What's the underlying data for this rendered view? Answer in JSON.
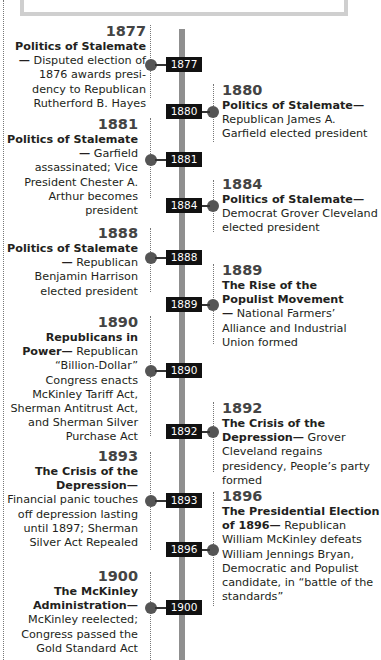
{
  "axis": {
    "color": "#8f8f8f"
  },
  "events": [
    {
      "year": "1877",
      "side": "left",
      "heading": "Politics of Stalemate—",
      "body": "Disputed election of 1876 awards presi-dency to Republican Rutherford B. Hayes",
      "label": "1877"
    },
    {
      "year": "1880",
      "side": "right",
      "heading": "Politics of Stalemate—",
      "body": "Republican James A. Garfield elected president",
      "label": "1880"
    },
    {
      "year": "1881",
      "side": "left",
      "heading": "Politics of Stalemate—",
      "body": "Garfield assassinated; Vice President Chester A. Arthur becomes president",
      "label": "1881"
    },
    {
      "year": "1884",
      "side": "right",
      "heading": "Politics of Stalemate—",
      "body": "Democrat Grover Cleveland elected president",
      "label": "1884"
    },
    {
      "year": "1888",
      "side": "left",
      "heading": "Politics of Stalemate—",
      "body": "Republican Benjamin Harrison elected president",
      "label": "1888"
    },
    {
      "year": "1889",
      "side": "right",
      "heading": "The Rise of the Populist Movement—",
      "body": "National Farmers’ Alliance and Industrial Union formed",
      "label": "1889"
    },
    {
      "year": "1890",
      "side": "left",
      "heading": "Republicans in Power—",
      "body": "Republican “Billion-Dollar” Congress enacts McKinley Tariff Act, Sherman Antitrust Act, and Sherman Silver Purchase Act",
      "label": "1890"
    },
    {
      "year": "1892",
      "side": "right",
      "heading": "The Crisis of the Depression—",
      "body": "Grover Cleveland regains presidency, People’s party formed",
      "label": "1892"
    },
    {
      "year": "1893",
      "side": "left",
      "heading": "The Crisis of the Depression—",
      "body": "Financial panic touches off depression lasting until 1897; Sherman Silver Act Repealed",
      "label": "1893"
    },
    {
      "year": "1896",
      "side": "right",
      "heading": "The Presidential Election of 1896—",
      "body": "Republican William McKinley defeats William Jennings Bryan, Democratic and Populist candidate, in “battle of the standards”",
      "label": "1896"
    },
    {
      "year": "1900",
      "side": "left",
      "heading": "The McKinley Administration—",
      "body": "McKinley reelected; Congress passed the Gold Standard Act",
      "label": "1900"
    }
  ]
}
